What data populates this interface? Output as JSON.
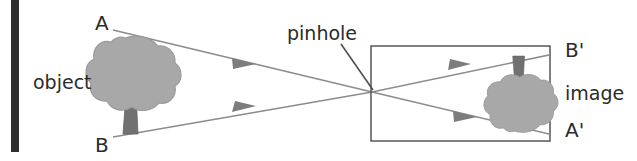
{
  "figure": {
    "background_color": "#ffffff",
    "width": 637,
    "height": 161
  },
  "labels": {
    "object": "object",
    "pinhole": "pinhole",
    "image": "image",
    "point_a": "A",
    "point_b": "B",
    "point_a_prime": "A'",
    "point_b_prime": "B'"
  },
  "colors": {
    "margin_bar": "#2e2e2e",
    "ray_line": "#8c8c8c",
    "arrowhead": "#7d7d7d",
    "box_outline": "#4a4a4a",
    "leader_line": "#4f4f4f",
    "foliage": "#a8a8a8",
    "foliage_outline": "#9a9a9a",
    "trunk": "#717171",
    "text": "#2b2b2b"
  },
  "elements": {
    "margin_bar": {
      "x": 11,
      "y": 0,
      "width": 8,
      "height": 152
    },
    "camera_box": {
      "x": 371,
      "y": 46,
      "width": 179,
      "height": 95
    },
    "pinhole_point": {
      "x": 372,
      "y": 92
    },
    "object_tree": {
      "cx": 131,
      "cy": 88,
      "inverted": false
    },
    "image_tree": {
      "cx": 519,
      "cy": 92,
      "inverted": true
    },
    "rays": [
      {
        "name": "ray-a",
        "from": "A",
        "to": "A'",
        "x1": 113,
        "y1": 30,
        "x2": 372,
        "y2": 92,
        "x3": 549,
        "y3": 134
      },
      {
        "name": "ray-b",
        "from": "B",
        "to": "B'",
        "x1": 113,
        "y1": 137,
        "x2": 372,
        "y2": 92,
        "x3": 549,
        "y3": 55
      }
    ],
    "leader_line": {
      "x1": 341,
      "y1": 44,
      "x2": 373,
      "y2": 90
    }
  }
}
